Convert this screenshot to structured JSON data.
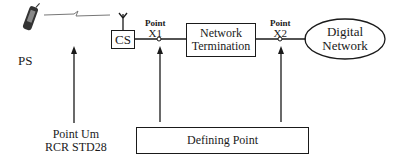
{
  "diagram": {
    "nodes": {
      "ps": {
        "label": "PS"
      },
      "cs": {
        "label": "CS"
      },
      "network_termination": {
        "line1": "Network",
        "line2": "Termination"
      },
      "digital_network": {
        "line1": "Digital",
        "line2": "Network"
      }
    },
    "points": {
      "x1": {
        "title": "Point",
        "id": "X1"
      },
      "x2": {
        "title": "Point",
        "id": "X2"
      },
      "um": {
        "line1": "Point Um",
        "line2": "RCR STD28"
      }
    },
    "defining_point": {
      "label": "Defining Point"
    }
  }
}
